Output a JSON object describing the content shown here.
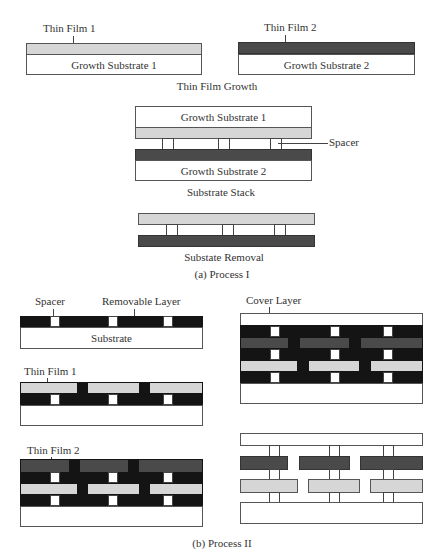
{
  "process1": {
    "caption": "(a) Process I",
    "step1": {
      "caption": "Thin Film Growth",
      "left": {
        "film_label": "Thin Film 1",
        "substrate_label": "Growth Substrate 1"
      },
      "right": {
        "film_label": "Thin Film 2",
        "substrate_label": "Growth Substrate 2"
      }
    },
    "step2": {
      "caption": "Substrate Stack",
      "top_substrate_label": "Growth Substrate 1",
      "bottom_substrate_label": "Growth Substrate 2",
      "spacer_label": "Spacer"
    },
    "step3": {
      "caption": "Substate Removal"
    }
  },
  "process2": {
    "caption": "(b) Process II",
    "panel1": {
      "spacer_label": "Spacer",
      "removable_label": "Removable Layer",
      "substrate_label": "Substrate"
    },
    "panel2": {
      "film_label": "Thin Film 1"
    },
    "panel3": {
      "film_label": "Thin Film 2"
    },
    "panel4": {
      "cover_label": "Cover Layer"
    }
  },
  "colors": {
    "thin_film_1": "#d6d6d6",
    "thin_film_2": "#4a4a4a",
    "removable_layer": "#141414",
    "substrate": "#ffffff"
  }
}
